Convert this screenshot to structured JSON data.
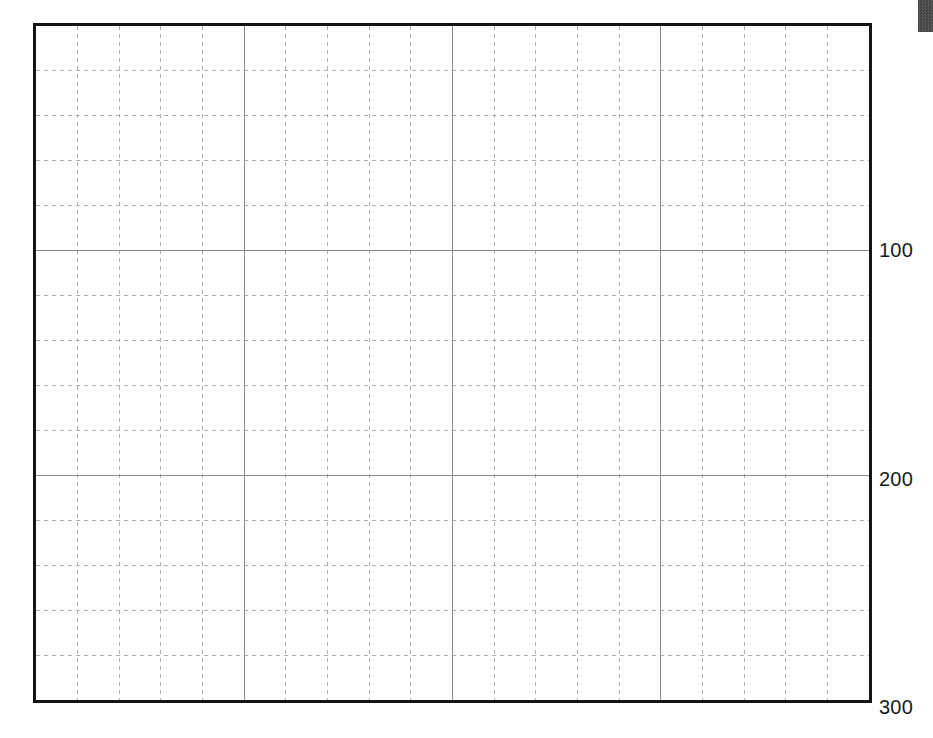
{
  "page": {
    "background_color": "#ffffff",
    "width": 933,
    "height": 738
  },
  "corner_marker": {
    "name": "page-edge-marker",
    "color": "#3a3a3a"
  },
  "plot": {
    "frame_color": "#151515",
    "frame_width_px": 3,
    "major_grid_color": "#8a8a8a",
    "minor_grid_color": "#b0b0b0",
    "plot_background": "#ffffff"
  },
  "chart_data": {
    "type": "line",
    "title": "",
    "subtitle": "",
    "xlabel": "",
    "ylabel": "",
    "series": [],
    "x": [],
    "grid": true,
    "grid_style": {
      "major": "solid",
      "minor": "dashed",
      "minor_divisions_x": 5,
      "minor_divisions_y": 5
    },
    "legend": null,
    "legend_position": "none",
    "annotations": [],
    "axis": {
      "y_label_side": "right",
      "y_direction": "inverted",
      "y_tick_labels": [
        "100",
        "200",
        "300"
      ],
      "y_tick_values": [
        100,
        200,
        300
      ],
      "ylim": [
        0,
        300
      ],
      "x_tick_labels": [],
      "x_tick_values": [],
      "xlim": [
        0,
        4
      ]
    },
    "major_gridlines": {
      "vertical_count": 3,
      "horizontal_count": 3
    }
  },
  "y_axis": {
    "ticks": [
      {
        "label": "100",
        "value": 100,
        "y_px": 240
      },
      {
        "label": "200",
        "value": 200,
        "y_px": 469
      },
      {
        "label": "300",
        "value": 300,
        "y_px": 697
      }
    ]
  }
}
